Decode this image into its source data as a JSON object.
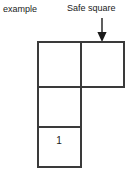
{
  "figure": {
    "kind": "grid-diagram",
    "background_color": "#ffffff",
    "line_color": "#3a3a3a",
    "text_color": "#1a1a1a",
    "example_label": "example",
    "safe_square_label": "Safe square",
    "arrow": {
      "name": "down-arrow",
      "direction": "down",
      "points_to": "top-right-cell"
    },
    "grid": {
      "description": "L-shaped arrangement of four equal squares",
      "columns": 2,
      "rows": 3,
      "cells": [
        {
          "row": 0,
          "col": 0,
          "label": ""
        },
        {
          "row": 0,
          "col": 1,
          "label": ""
        },
        {
          "row": 1,
          "col": 0,
          "label": ""
        },
        {
          "row": 2,
          "col": 0,
          "label": "1"
        }
      ],
      "numbered_cell_value": "1"
    }
  }
}
